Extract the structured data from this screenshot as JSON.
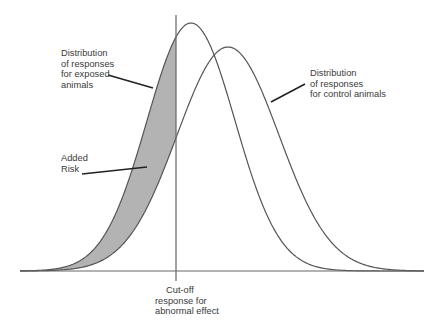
{
  "diagram": {
    "title": "",
    "colors": {
      "background": "#ffffff",
      "curve_stroke": "#555555",
      "axis_stroke": "#666666",
      "added_risk_fill": "#b3b3b3",
      "leader_line": "#222222",
      "text": "#3a3a3a"
    },
    "geometry": {
      "baseline_y": 271,
      "baseline_x_start": 20,
      "baseline_x_end": 424,
      "cutoff_x": 176,
      "cutoff_y_top": 15,
      "cutoff_y_bottom": 281,
      "exposed": {
        "mean_x": 191,
        "peak_height": 248,
        "sigma": 44
      },
      "control": {
        "mean_x": 228,
        "peak_height": 224,
        "sigma": 51
      }
    },
    "labels": {
      "exposed": [
        "Distribution",
        "of responses",
        "for exposed",
        "animals"
      ],
      "control": [
        "Distribution",
        "of responses",
        "for control animals"
      ],
      "added_risk": [
        "Added",
        "Risk"
      ],
      "cutoff": [
        "Cut-off",
        "response for",
        "abnormal effect"
      ]
    },
    "leaders": {
      "exposed": [
        108,
        75,
        153,
        88
      ],
      "control": [
        271,
        102,
        305,
        84
      ],
      "added_risk": [
        82,
        174,
        147,
        167
      ]
    }
  }
}
